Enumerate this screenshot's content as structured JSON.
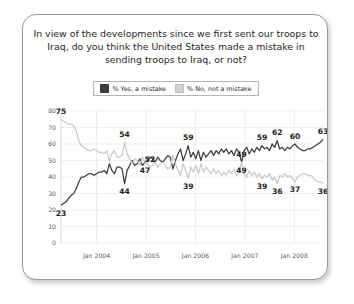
{
  "card": {
    "title": "In view of the developments since we first sent our troops to Iraq, do you think the United States made a mistake in sending troops to Iraq, or not?"
  },
  "legend": {
    "items": [
      {
        "label": "% Yes, a mistake",
        "color": "#3d3d3d",
        "swatch": "legend-swatch-yes"
      },
      {
        "label": "% No, not a mistake",
        "color": "#d2d2d2",
        "swatch": "legend-swatch-no"
      }
    ]
  },
  "chart_data": {
    "type": "line",
    "title": "In view of the developments since we first sent our troops to Iraq, do you think the United States made a mistake in sending troops to Iraq, or not?",
    "xlabel": "",
    "ylabel": "",
    "ylim": [
      0,
      80
    ],
    "yticks": [
      0,
      10,
      20,
      30,
      40,
      50,
      60,
      70,
      80
    ],
    "xticks": [
      "Jan 2004",
      "Jan 2005",
      "Jan 2006",
      "Jan 2007",
      "Jan 2008"
    ],
    "xlim": [
      "2003-04",
      "2008-07"
    ],
    "grid": true,
    "legend_position": "top-center",
    "series": [
      {
        "name": "% Yes, a mistake",
        "color": "#3d3d3d",
        "values": [
          23,
          24,
          25,
          27,
          29,
          30,
          33,
          37,
          40,
          40,
          41,
          42,
          42,
          41,
          42,
          43,
          43,
          44,
          42,
          48,
          44,
          42,
          46,
          46,
          45,
          36,
          44,
          47,
          50,
          47,
          48,
          51,
          47,
          49,
          50,
          52,
          51,
          49,
          52,
          50,
          49,
          51,
          53,
          52,
          45,
          50,
          54,
          57,
          50,
          54,
          59,
          52,
          55,
          51,
          56,
          50,
          55,
          52,
          54,
          56,
          53,
          56,
          54,
          57,
          55,
          57,
          54,
          56,
          53,
          57,
          55,
          49,
          56,
          58,
          54,
          57,
          55,
          58,
          56,
          59,
          57,
          58,
          56,
          60,
          58,
          62,
          57,
          58,
          56,
          58,
          57,
          59,
          60,
          58,
          57,
          56,
          56,
          57,
          57,
          58,
          59,
          60,
          61,
          63
        ]
      },
      {
        "name": "% No, not a mistake",
        "color": "#c9c9c9",
        "values": [
          75,
          74,
          73,
          72,
          72,
          71,
          68,
          62,
          59,
          58,
          57,
          56,
          56,
          57,
          56,
          55,
          55,
          54,
          56,
          50,
          54,
          56,
          52,
          52,
          53,
          61,
          54,
          51,
          48,
          51,
          50,
          47,
          52,
          49,
          48,
          46,
          47,
          49,
          46,
          48,
          49,
          47,
          45,
          46,
          53,
          48,
          44,
          41,
          48,
          44,
          39,
          46,
          43,
          47,
          42,
          48,
          43,
          46,
          44,
          42,
          45,
          42,
          44,
          41,
          43,
          41,
          44,
          42,
          45,
          41,
          43,
          49,
          42,
          40,
          44,
          41,
          43,
          40,
          42,
          39,
          41,
          40,
          42,
          38,
          40,
          36,
          41,
          40,
          42,
          40,
          41,
          39,
          37,
          40,
          41,
          42,
          42,
          41,
          41,
          40,
          38,
          37,
          37,
          36
        ]
      }
    ],
    "point_labels": [
      {
        "series": "% Yes, a mistake",
        "index": 0,
        "value": 23,
        "pos": "below"
      },
      {
        "series": "% Yes, a mistake",
        "index": 25,
        "value": 44,
        "pos": "below"
      },
      {
        "series": "% Yes, a mistake",
        "index": 33,
        "value": 47,
        "pos": "below"
      },
      {
        "series": "% Yes, a mistake",
        "index": 50,
        "value": 59,
        "pos": "above"
      },
      {
        "series": "% Yes, a mistake",
        "index": 71,
        "value": 49,
        "pos": "above"
      },
      {
        "series": "% Yes, a mistake",
        "index": 79,
        "value": 59,
        "pos": "above"
      },
      {
        "series": "% Yes, a mistake",
        "index": 85,
        "value": 62,
        "pos": "above"
      },
      {
        "series": "% Yes, a mistake",
        "index": 92,
        "value": 60,
        "pos": "above"
      },
      {
        "series": "% Yes, a mistake",
        "index": 103,
        "value": 63,
        "pos": "above"
      },
      {
        "series": "% No, not a mistake",
        "index": 0,
        "value": 75,
        "pos": "above"
      },
      {
        "series": "% No, not a mistake",
        "index": 25,
        "value": 54,
        "pos": "above"
      },
      {
        "series": "% No, not a mistake",
        "index": 35,
        "value": 52,
        "pos": "above"
      },
      {
        "series": "% No, not a mistake",
        "index": 50,
        "value": 39,
        "pos": "below"
      },
      {
        "series": "% No, not a mistake",
        "index": 71,
        "value": 49,
        "pos": "below"
      },
      {
        "series": "% No, not a mistake",
        "index": 79,
        "value": 39,
        "pos": "below"
      },
      {
        "series": "% No, not a mistake",
        "index": 85,
        "value": 36,
        "pos": "below"
      },
      {
        "series": "% No, not a mistake",
        "index": 92,
        "value": 37,
        "pos": "below"
      },
      {
        "series": "% No, not a mistake",
        "index": 103,
        "value": 36,
        "pos": "below"
      }
    ]
  }
}
